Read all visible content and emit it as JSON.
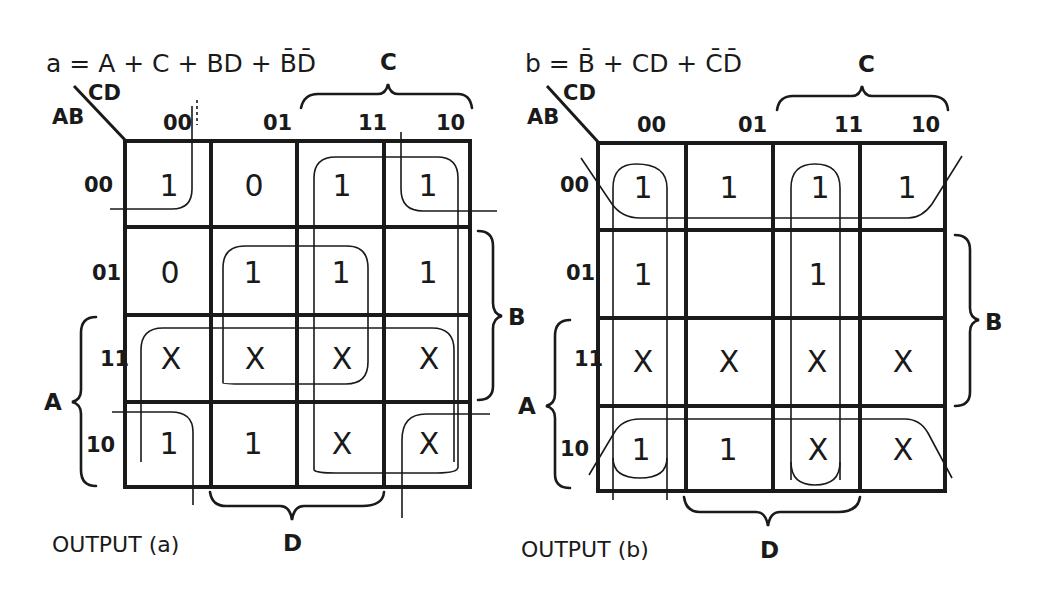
{
  "maps": [
    {
      "id": "a",
      "equation": "a = A + C + BD + B̄D̄",
      "corner_row_var": "AB",
      "corner_col_var": "CD",
      "col_headers": [
        "00",
        "01",
        "11",
        "10"
      ],
      "row_headers": [
        "00",
        "01",
        "11",
        "10"
      ],
      "cells": [
        [
          "1",
          "0",
          "1",
          "1"
        ],
        [
          "0",
          "1",
          "1",
          "1"
        ],
        [
          "X",
          "X",
          "X",
          "X"
        ],
        [
          "1",
          "1",
          "X",
          "X"
        ]
      ],
      "brace_top": "C",
      "brace_right": "B",
      "brace_left": "A",
      "brace_bottom": "D",
      "caption": "OUTPUT (a)"
    },
    {
      "id": "b",
      "equation": "b = B̄ + CD + C̄D̄",
      "corner_row_var": "AB",
      "corner_col_var": "CD",
      "col_headers": [
        "00",
        "01",
        "11",
        "10"
      ],
      "row_headers": [
        "00",
        "01",
        "11",
        "10"
      ],
      "cells": [
        [
          "1",
          "1",
          "1",
          "1"
        ],
        [
          "1",
          "",
          "1",
          ""
        ],
        [
          "X",
          "X",
          "X",
          "X"
        ],
        [
          "1",
          "1",
          "X",
          "X"
        ]
      ],
      "brace_top": "C",
      "brace_right": "B",
      "brace_left": "A",
      "brace_bottom": "D",
      "caption": "OUTPUT (b)"
    }
  ]
}
